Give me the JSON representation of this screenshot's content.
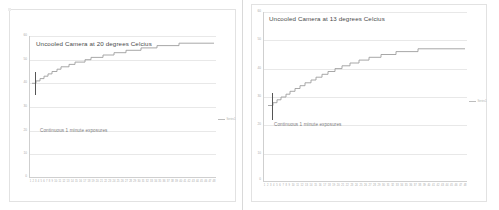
{
  "document": {
    "background_color": "#ffffff",
    "panel_divider_color": "#d9d9d9"
  },
  "charts": [
    {
      "id": "left",
      "title": "Uncooled Camera at 20 degrees Celcius",
      "annotation": "Continuous 1 minute exposures",
      "legend_label": "Series1",
      "series_color": "#9e9e9e",
      "grid_color": "#e8e8e8",
      "yticks": [
        "60",
        "50",
        "40",
        "30",
        "20",
        "10",
        "0"
      ],
      "xticks": [
        "1",
        "2",
        "3",
        "4",
        "5",
        "6",
        "7",
        "8",
        "9",
        "10",
        "11",
        "12",
        "13",
        "14",
        "15",
        "16",
        "17",
        "18",
        "19",
        "20",
        "21",
        "22",
        "23",
        "24",
        "25",
        "26",
        "27",
        "28",
        "29",
        "30",
        "31",
        "32",
        "33",
        "34",
        "35",
        "36",
        "37",
        "38",
        "39",
        "40",
        "41",
        "42",
        "43",
        "44",
        "45",
        "46",
        "47",
        "48"
      ]
    },
    {
      "id": "right",
      "title": "Uncooled Camera at 13 degrees Celcius",
      "annotation": "Continuous 1 minute exposures",
      "legend_label": "Series1",
      "series_color": "#9e9e9e",
      "grid_color": "#e8e8e8",
      "yticks": [
        "60",
        "50",
        "40",
        "30",
        "20",
        "10",
        "0"
      ],
      "xticks": [
        "1",
        "2",
        "3",
        "4",
        "5",
        "6",
        "7",
        "8",
        "9",
        "10",
        "11",
        "12",
        "13",
        "14",
        "15",
        "16",
        "17",
        "18",
        "19",
        "20",
        "21",
        "22",
        "23",
        "24",
        "25",
        "26",
        "27",
        "28",
        "29",
        "30",
        "31",
        "32",
        "33",
        "34",
        "35",
        "36",
        "37",
        "38",
        "39",
        "40",
        "41",
        "42",
        "43",
        "44",
        "45",
        "46",
        "47",
        "48"
      ]
    }
  ],
  "chart_data": [
    {
      "type": "line",
      "id": "left",
      "title": "Uncooled Camera at 20 degrees Celcius",
      "annotation": "Continuous 1 minute exposures",
      "xlabel": "",
      "ylabel": "",
      "xlim": [
        1,
        48
      ],
      "ylim": [
        0,
        60
      ],
      "grid": true,
      "legend_position": "right",
      "legend": [
        "Series1"
      ],
      "x": [
        1,
        2,
        3,
        4,
        5,
        6,
        7,
        8,
        9,
        10,
        11,
        12,
        13,
        14,
        15,
        16,
        17,
        18,
        19,
        20,
        21,
        22,
        23,
        24,
        25,
        26,
        27,
        28,
        29,
        30,
        31,
        32,
        33,
        34,
        35,
        36,
        37,
        38,
        39,
        40,
        41,
        42,
        43,
        44,
        45,
        46,
        47,
        48
      ],
      "values": [
        40,
        40,
        41,
        41,
        42,
        42,
        43,
        43,
        44,
        44,
        45,
        45,
        46,
        46,
        46,
        47,
        47,
        48,
        48,
        48,
        49,
        49,
        49,
        50,
        50,
        50,
        50,
        51,
        51,
        51,
        51,
        51,
        52,
        52,
        52,
        52,
        52,
        53,
        53,
        53,
        53,
        53,
        54,
        54,
        54,
        54,
        54,
        54
      ],
      "series": [
        {
          "name": "Series1",
          "values": [
            40,
            40,
            41,
            41,
            42,
            42,
            43,
            43,
            44,
            44,
            45,
            45,
            46,
            46,
            46,
            47,
            47,
            48,
            48,
            48,
            49,
            49,
            49,
            50,
            50,
            50,
            50,
            51,
            51,
            51,
            51,
            51,
            52,
            52,
            52,
            52,
            52,
            53,
            53,
            53,
            53,
            53,
            54,
            54,
            54,
            54,
            54,
            54
          ]
        }
      ]
    },
    {
      "type": "line",
      "id": "right",
      "title": "Uncooled Camera at 13 degrees Celcius",
      "annotation": "Continuous 1 minute exposures",
      "xlabel": "",
      "ylabel": "",
      "xlim": [
        1,
        48
      ],
      "ylim": [
        0,
        60
      ],
      "grid": true,
      "legend_position": "right",
      "legend": [
        "Series1"
      ],
      "x": [
        1,
        2,
        3,
        4,
        5,
        6,
        7,
        8,
        9,
        10,
        11,
        12,
        13,
        14,
        15,
        16,
        17,
        18,
        19,
        20,
        21,
        22,
        23,
        24,
        25,
        26,
        27,
        28,
        29,
        30,
        31,
        32,
        33,
        34,
        35,
        36,
        37,
        38,
        39,
        40,
        41,
        42,
        43,
        44,
        45,
        46,
        47,
        48
      ],
      "values": [
        27,
        27,
        28,
        29,
        30,
        31,
        32,
        33,
        34,
        35,
        36,
        37,
        38,
        39,
        40,
        41,
        42,
        43,
        44,
        45,
        46,
        46,
        47,
        47,
        48,
        48,
        48,
        49,
        49,
        49,
        49,
        50,
        50,
        50,
        50,
        50,
        50,
        50,
        50,
        50,
        50,
        50,
        50,
        50,
        50,
        50,
        50,
        50
      ],
      "series": [
        {
          "name": "Series1",
          "values": [
            27,
            27,
            28,
            29,
            30,
            31,
            32,
            33,
            34,
            35,
            36,
            37,
            38,
            39,
            40,
            41,
            42,
            43,
            44,
            45,
            46,
            46,
            47,
            47,
            48,
            48,
            48,
            49,
            49,
            49,
            49,
            50,
            50,
            50,
            50,
            50,
            50,
            50,
            50,
            50,
            50,
            50,
            50,
            50,
            50,
            50,
            50,
            50
          ]
        }
      ]
    }
  ]
}
